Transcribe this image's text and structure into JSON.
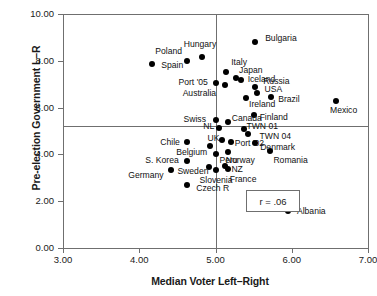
{
  "chart_data": {
    "type": "scatter",
    "title": "",
    "xlabel": "Median Voter Left–Right",
    "ylabel": "Pre-election Government L–R",
    "xlim": [
      3.0,
      7.0
    ],
    "ylim": [
      0.0,
      10.0
    ],
    "xticks": [
      "3.00",
      "4.00",
      "5.00",
      "6.00",
      "7.00"
    ],
    "yticks": [
      "0.00",
      "2.00",
      "4.00",
      "6.00",
      "8.00",
      "10.00"
    ],
    "grid": false,
    "legend": "none",
    "annotation": "r = .06",
    "reference_lines": {
      "horizontal_y": 5.2,
      "vertical_x": 5.0
    },
    "points": [
      {
        "label": "Bulgaria",
        "x": 5.52,
        "y": 8.8,
        "lx": 10,
        "ly": -4
      },
      {
        "label": "Hungary",
        "x": 4.82,
        "y": 8.18,
        "lx": -18,
        "ly": -13
      },
      {
        "label": "Poland",
        "x": 4.63,
        "y": 8.0,
        "lx": -32,
        "ly": -10
      },
      {
        "label": "Spain",
        "x": 4.17,
        "y": 7.85,
        "lx": 9,
        "ly": 1
      },
      {
        "label": "Italy",
        "x": 5.14,
        "y": 7.53,
        "lx": 5,
        "ly": -10
      },
      {
        "label": "Japan",
        "x": 5.27,
        "y": 7.28,
        "lx": 3,
        "ly": -8
      },
      {
        "label": "Iceland",
        "x": 5.33,
        "y": 7.2,
        "lx": 7,
        "ly": -1
      },
      {
        "label": "Port '05",
        "x": 5.0,
        "y": 7.03,
        "lx": -37,
        "ly": -1
      },
      {
        "label": "Australia",
        "x": 5.12,
        "y": 6.98,
        "lx": -42,
        "ly": 8
      },
      {
        "label": "Russia",
        "x": 5.52,
        "y": 6.9,
        "lx": 8,
        "ly": -6
      },
      {
        "label": "USA",
        "x": 5.55,
        "y": 6.62,
        "lx": 7,
        "ly": -4
      },
      {
        "label": "Brazil",
        "x": 5.73,
        "y": 6.45,
        "lx": 7,
        "ly": 2
      },
      {
        "label": "Ireland",
        "x": 5.4,
        "y": 6.42,
        "lx": 3,
        "ly": 6
      },
      {
        "label": "Mexico",
        "x": 6.58,
        "y": 6.3,
        "lx": -6,
        "ly": 9
      },
      {
        "label": "Finland",
        "x": 5.5,
        "y": 5.7,
        "lx": 6,
        "ly": 2
      },
      {
        "label": "Swiss",
        "x": 5.0,
        "y": 5.45,
        "lx": -32,
        "ly": -1
      },
      {
        "label": "Canada",
        "x": 5.16,
        "y": 5.4,
        "lx": 4,
        "ly": -4
      },
      {
        "label": "NL",
        "x": 5.05,
        "y": 5.13,
        "lx": -16,
        "ly": -2
      },
      {
        "label": "TWN 01",
        "x": 5.38,
        "y": 5.08,
        "lx": 2,
        "ly": -3
      },
      {
        "label": "TWN 04",
        "x": 5.42,
        "y": 4.88,
        "lx": 12,
        "ly": 2
      },
      {
        "label": "UK",
        "x": 5.08,
        "y": 4.62,
        "lx": -14,
        "ly": -2
      },
      {
        "label": "Chile",
        "x": 4.63,
        "y": 4.55,
        "lx": -27,
        "ly": 0
      },
      {
        "label": "Port '02",
        "x": 5.2,
        "y": 4.52,
        "lx": 4,
        "ly": 1
      },
      {
        "label": "Denmark",
        "x": 5.52,
        "y": 4.5,
        "lx": 5,
        "ly": 4
      },
      {
        "label": "Belgium",
        "x": 4.93,
        "y": 4.38,
        "lx": -34,
        "ly": 6
      },
      {
        "label": "Romania",
        "x": 5.72,
        "y": 4.15,
        "lx": 3,
        "ly": 9
      },
      {
        "label": "Norway",
        "x": 5.16,
        "y": 4.1,
        "lx": -2,
        "ly": 8
      },
      {
        "label": "Peru",
        "x": 5.0,
        "y": 4.03,
        "lx": 4,
        "ly": 6
      },
      {
        "label": "S. Korea",
        "x": 4.63,
        "y": 3.72,
        "lx": -42,
        "ly": -1
      },
      {
        "label": "NZ",
        "x": 5.13,
        "y": 3.5,
        "lx": 6,
        "ly": 3
      },
      {
        "label": "Sweden",
        "x": 4.92,
        "y": 3.47,
        "lx": -32,
        "ly": 4
      },
      {
        "label": "France",
        "x": 5.16,
        "y": 3.38,
        "lx": 2,
        "ly": 10
      },
      {
        "label": "Germany",
        "x": 4.42,
        "y": 3.33,
        "lx": -43,
        "ly": 5
      },
      {
        "label": "Slovenia",
        "x": 5.0,
        "y": 3.33,
        "lx": -16,
        "ly": 10
      },
      {
        "label": "Czech R",
        "x": 4.63,
        "y": 2.7,
        "lx": 9,
        "ly": 3
      },
      {
        "label": "Albania",
        "x": 5.95,
        "y": 1.6,
        "lx": 9,
        "ly": 0
      }
    ]
  }
}
